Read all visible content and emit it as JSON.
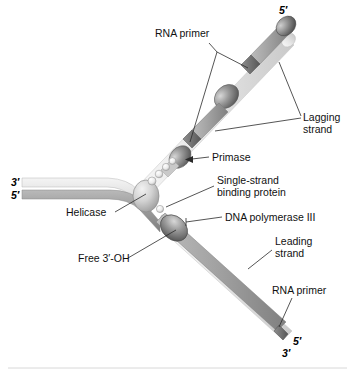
{
  "figure": {
    "background_color": "#ffffff"
  },
  "labels": {
    "rna_primer_top": "RNA primer",
    "lagging_strand_line1": "Lagging",
    "lagging_strand_line2": "strand",
    "primase": "Primase",
    "ssb_line1": "Single-strand",
    "ssb_line2": "binding protein",
    "helicase": "Helicase",
    "dna_pol_iii": "DNA polymerase III",
    "leading_strand_line1": "Leading",
    "leading_strand_line2": "strand",
    "free_3_oh": "Free 3′-OH",
    "rna_primer_bottom": "RNA primer"
  },
  "end_labels": {
    "parental_top_left": "3′",
    "parental_bottom_left": "5′",
    "lagging_top_right": "5′",
    "leading_bottom_right_upper": "5′",
    "leading_bottom_right_lower": "3′"
  },
  "colors": {
    "template_light": "#e2e2e2",
    "template_mid": "#cfcfcf",
    "new_strand_dark": "#9a9a9a",
    "primer_dark": "#6e6e6e",
    "protein_fill": "#8d8d8d",
    "protein_dark": "#5c5c5c",
    "ssb_fill": "#f0f0f0",
    "outline": "#6a6a6a",
    "text": "#111111"
  },
  "elements": {
    "helicase_name": "helicase-protein",
    "primase_name": "primase-protein",
    "pol3_name": "dna-polymerase-iii-protein",
    "ssb_name": "single-strand-binding-protein",
    "okazaki_name": "okazaki-fragment",
    "primer_name": "rna-primer-segment"
  }
}
